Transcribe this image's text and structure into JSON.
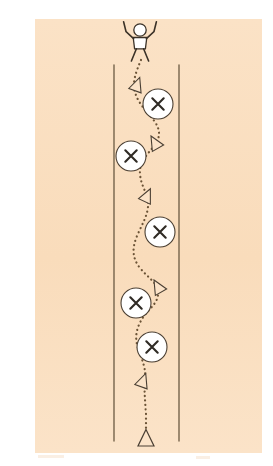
{
  "diagram": {
    "type": "sports-drill-diagram",
    "background_color": "#fae0c3",
    "page_color": "#ffffff",
    "ink_color": "#3b3228",
    "path_color": "#6b5336",
    "marker_fill": "#ffffff",
    "field": {
      "label": "playing-area",
      "left": 35,
      "top": 19,
      "width": 227,
      "height": 434
    },
    "boundary_lines": [
      {
        "name": "left-boundary-line",
        "x": 114,
        "y1": 65,
        "y2": 441
      },
      {
        "name": "right-boundary-line",
        "x": 179,
        "y1": 65,
        "y2": 441
      }
    ],
    "player": {
      "name": "player-figure",
      "label": "Player",
      "x": 140,
      "y": 42,
      "pose": "arms-raised"
    },
    "cones": [
      {
        "id": 1,
        "label": "x",
        "x": 158,
        "y": 104,
        "r": 15
      },
      {
        "id": 2,
        "label": "x",
        "x": 131,
        "y": 156,
        "r": 15
      },
      {
        "id": 3,
        "label": "x",
        "x": 160,
        "y": 232,
        "r": 15
      },
      {
        "id": 4,
        "label": "x",
        "x": 136,
        "y": 303,
        "r": 15
      },
      {
        "id": 5,
        "label": "x",
        "x": 152,
        "y": 347,
        "r": 15
      }
    ],
    "arrows": [
      {
        "id": 1,
        "x": 137,
        "y": 85,
        "rotation": 200
      },
      {
        "id": 2,
        "x": 155,
        "y": 143,
        "rotation": 150
      },
      {
        "id": 3,
        "x": 147,
        "y": 196,
        "rotation": 205
      },
      {
        "id": 4,
        "x": 158,
        "y": 287,
        "rotation": 150
      },
      {
        "id": 5,
        "x": 143,
        "y": 381,
        "rotation": 200
      },
      {
        "id": 6,
        "x": 146,
        "y": 439,
        "rotation": 180
      }
    ],
    "path": {
      "name": "dribble-path",
      "style": "dotted",
      "description": "zigzag slalom route weaving between five marker cones"
    }
  }
}
